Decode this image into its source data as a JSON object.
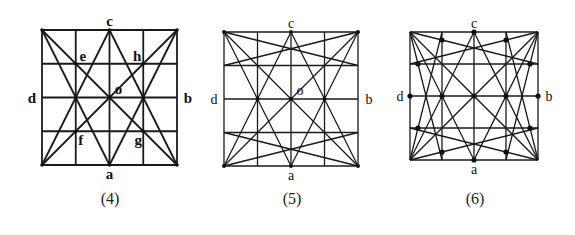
{
  "figures": [
    {
      "id": "fig4",
      "caption": "(4)",
      "box": {
        "x": 42,
        "y": 30,
        "size": 135
      },
      "grid_divisions": 4,
      "labels": {
        "top": "c",
        "bottom": "a",
        "left": "d",
        "right": "b",
        "center": "o",
        "e": "e",
        "h": "h",
        "f": "f",
        "g": "g"
      },
      "label_style": "bold",
      "lines": [
        [
          [
            0,
            0
          ],
          [
            4,
            4
          ]
        ],
        [
          [
            4,
            0
          ],
          [
            0,
            4
          ]
        ],
        [
          [
            0,
            0
          ],
          [
            2,
            4
          ]
        ],
        [
          [
            4,
            0
          ],
          [
            2,
            4
          ]
        ],
        [
          [
            2,
            0
          ],
          [
            0,
            4
          ]
        ],
        [
          [
            2,
            0
          ],
          [
            4,
            4
          ]
        ]
      ],
      "dots": [
        [
          1,
          2
        ],
        [
          2,
          2
        ],
        [
          3,
          2
        ],
        [
          1,
          1
        ],
        [
          3,
          1
        ],
        [
          1,
          3
        ],
        [
          3,
          3
        ],
        [
          2,
          0
        ],
        [
          2,
          4
        ],
        [
          0,
          0
        ],
        [
          4,
          0
        ],
        [
          0,
          4
        ],
        [
          4,
          4
        ]
      ],
      "dot_radius": 1.8
    },
    {
      "id": "fig5",
      "caption": "(5)",
      "box": {
        "x": 224,
        "y": 32,
        "size": 134
      },
      "grid_divisions": 4,
      "labels": {
        "top": "c",
        "bottom": "a",
        "left": "d",
        "right": "b",
        "center": "o"
      },
      "label_style": "normal",
      "lines": [
        [
          [
            0,
            0
          ],
          [
            4,
            4
          ]
        ],
        [
          [
            4,
            0
          ],
          [
            0,
            4
          ]
        ],
        [
          [
            0,
            0
          ],
          [
            2,
            4
          ]
        ],
        [
          [
            4,
            0
          ],
          [
            2,
            4
          ]
        ],
        [
          [
            2,
            0
          ],
          [
            0,
            4
          ]
        ],
        [
          [
            2,
            0
          ],
          [
            4,
            4
          ]
        ],
        [
          [
            0,
            0
          ],
          [
            4,
            1
          ]
        ],
        [
          [
            4,
            0
          ],
          [
            0,
            1
          ]
        ],
        [
          [
            0,
            4
          ],
          [
            4,
            3
          ]
        ],
        [
          [
            4,
            4
          ],
          [
            0,
            3
          ]
        ]
      ],
      "dots": [
        [
          1,
          2
        ],
        [
          2,
          2
        ],
        [
          3,
          2
        ],
        [
          0,
          0
        ],
        [
          4,
          0
        ],
        [
          0,
          4
        ],
        [
          4,
          4
        ],
        [
          2,
          0
        ],
        [
          2,
          4
        ]
      ],
      "dot_radius": 2
    },
    {
      "id": "fig6",
      "caption": "(6)",
      "box": {
        "x": 410,
        "y": 32,
        "size": 128
      },
      "grid_divisions": 4,
      "labels": {
        "top": "c",
        "bottom": "a",
        "left": "d",
        "right": "b"
      },
      "label_style": "normal",
      "lines": [
        [
          [
            0,
            0
          ],
          [
            4,
            4
          ]
        ],
        [
          [
            4,
            0
          ],
          [
            0,
            4
          ]
        ],
        [
          [
            0,
            0
          ],
          [
            2,
            4
          ]
        ],
        [
          [
            4,
            0
          ],
          [
            2,
            4
          ]
        ],
        [
          [
            2,
            0
          ],
          [
            0,
            4
          ]
        ],
        [
          [
            2,
            0
          ],
          [
            4,
            4
          ]
        ],
        [
          [
            0,
            0
          ],
          [
            4,
            1
          ]
        ],
        [
          [
            4,
            0
          ],
          [
            0,
            1
          ]
        ],
        [
          [
            0,
            4
          ],
          [
            4,
            3
          ]
        ],
        [
          [
            4,
            4
          ],
          [
            0,
            3
          ]
        ],
        [
          [
            0,
            0
          ],
          [
            1,
            4
          ]
        ],
        [
          [
            4,
            0
          ],
          [
            3,
            4
          ]
        ],
        [
          [
            0,
            4
          ],
          [
            1,
            0
          ]
        ],
        [
          [
            4,
            4
          ],
          [
            3,
            0
          ]
        ]
      ],
      "dots": [
        [
          2,
          0
        ],
        [
          2,
          4
        ],
        [
          0,
          2
        ],
        [
          4,
          2
        ],
        [
          2,
          2
        ],
        [
          1,
          2
        ],
        [
          3,
          2
        ],
        [
          1,
          0.25
        ],
        [
          3,
          0.25
        ],
        [
          0.25,
          1
        ],
        [
          3.75,
          1
        ],
        [
          0.25,
          3
        ],
        [
          3.75,
          3
        ],
        [
          1,
          3.75
        ],
        [
          3,
          3.75
        ]
      ],
      "dot_radius": 2.6
    }
  ]
}
